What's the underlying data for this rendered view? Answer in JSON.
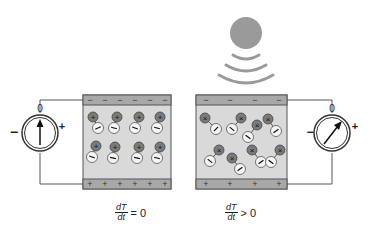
{
  "diagram": {
    "colors": {
      "background": "#ffffff",
      "crystal_fill": "#d9d9d9",
      "electrode_fill": "#a8a8a8",
      "electrode_stroke": "#555555",
      "positive_ion": "#7a7a7a",
      "negative_ion": "#f5f5f5",
      "wire": "#555555",
      "heat_source": "#9a9a9a"
    },
    "heat_source": {
      "label": "heat-source",
      "waves": 3
    },
    "left_panel": {
      "state": "no-temperature-change",
      "top_electrode_signs": [
        "−",
        "−",
        "−",
        "−",
        "−",
        "−"
      ],
      "bottom_electrode_signs": [
        "+",
        "+",
        "+",
        "+",
        "+",
        "+"
      ],
      "dipole_rows": 2,
      "dipoles_per_row": 4,
      "dipole_orientation": "aligned",
      "meter": {
        "zero_label": "0",
        "minus_label": "−",
        "plus_label": "+",
        "needle": "center"
      },
      "formula": {
        "numerator": "dT",
        "denominator": "dt",
        "relation": "= 0"
      }
    },
    "right_panel": {
      "state": "heating",
      "top_electrode_signs": [
        "−",
        "−",
        "−",
        "−"
      ],
      "bottom_electrode_signs": [
        "+",
        "+",
        "+",
        "+"
      ],
      "dipole_count": 8,
      "dipole_orientation": "disordered",
      "meter": {
        "zero_label": "0",
        "minus_label": "−",
        "plus_label": "+",
        "needle": "deflected-right"
      },
      "formula": {
        "numerator": "dT",
        "denominator": "dt",
        "relation": "> 0"
      }
    }
  }
}
